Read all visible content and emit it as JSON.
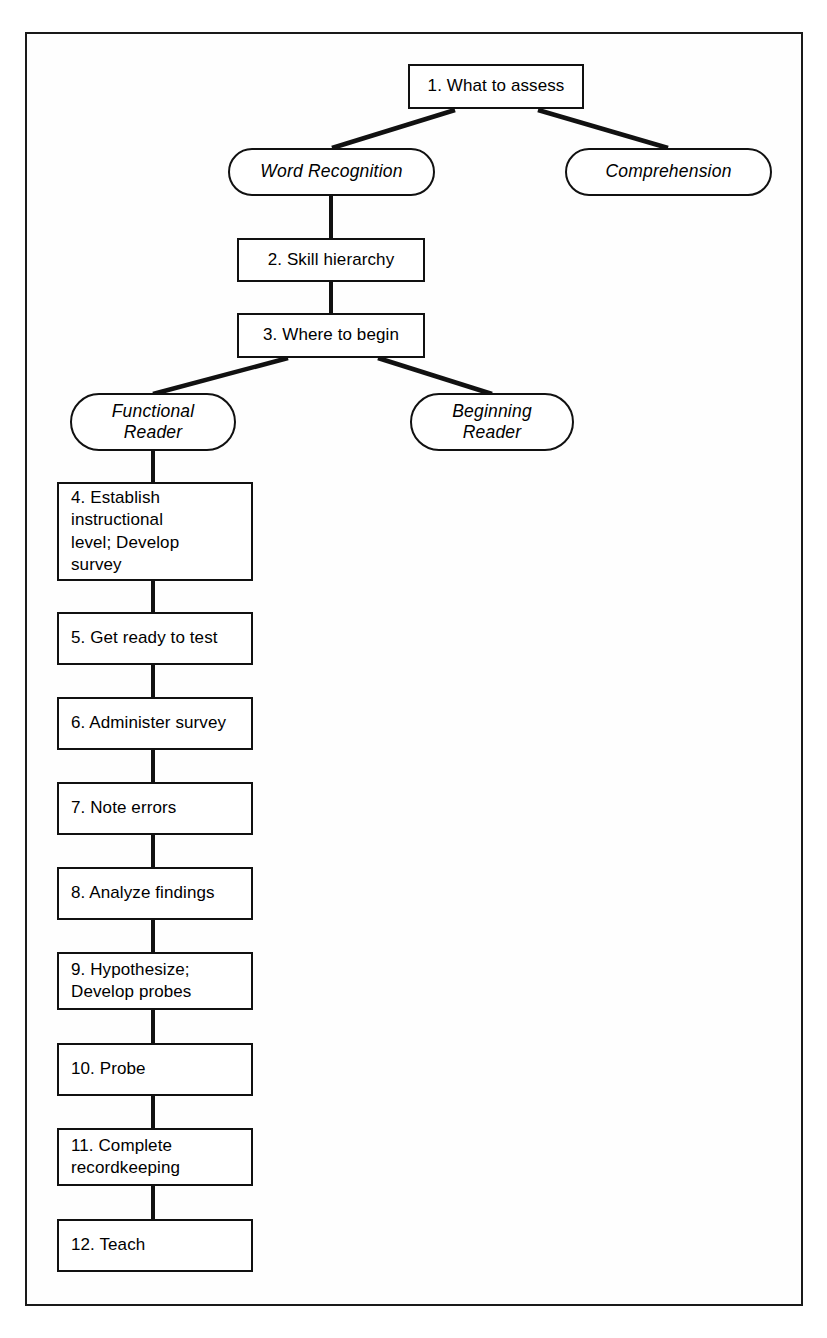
{
  "figure": {
    "frame": {
      "stroke_color": "#1a1a1a",
      "background": "#ffffff"
    },
    "line_color": "#111111"
  },
  "nodes": [
    {
      "id": "n1",
      "shape": "process",
      "label": "1.  What to assess",
      "x": 408,
      "y": 64,
      "w": 176,
      "h": 45,
      "align": "center"
    },
    {
      "id": "n2",
      "shape": "terminal",
      "label": "Word Recognition",
      "x": 228,
      "y": 148,
      "w": 207,
      "h": 48
    },
    {
      "id": "n3",
      "shape": "terminal",
      "label": "Comprehension",
      "x": 565,
      "y": 148,
      "w": 207,
      "h": 48
    },
    {
      "id": "n4",
      "shape": "process",
      "label": "2.  Skill hierarchy",
      "x": 237,
      "y": 238,
      "w": 188,
      "h": 44,
      "align": "center"
    },
    {
      "id": "n5",
      "shape": "process",
      "label": "3.  Where to begin",
      "x": 237,
      "y": 313,
      "w": 188,
      "h": 45,
      "align": "center"
    },
    {
      "id": "n6",
      "shape": "terminal",
      "label": "Functional\nReader",
      "x": 70,
      "y": 393,
      "w": 166,
      "h": 58
    },
    {
      "id": "n7",
      "shape": "terminal",
      "label": "Beginning\nReader",
      "x": 410,
      "y": 393,
      "w": 164,
      "h": 58
    },
    {
      "id": "n8",
      "shape": "process",
      "label": "4.  Establish\n     instructional\n     level; Develop\n     survey",
      "x": 57,
      "y": 482,
      "w": 196,
      "h": 99,
      "align": "left"
    },
    {
      "id": "n9",
      "shape": "process",
      "label": "5.  Get ready to test",
      "x": 57,
      "y": 612,
      "w": 196,
      "h": 53,
      "align": "left"
    },
    {
      "id": "n10",
      "shape": "process",
      "label": "6.  Administer survey",
      "x": 57,
      "y": 697,
      "w": 196,
      "h": 53,
      "align": "left"
    },
    {
      "id": "n11",
      "shape": "process",
      "label": "7.  Note errors",
      "x": 57,
      "y": 782,
      "w": 196,
      "h": 53,
      "align": "left"
    },
    {
      "id": "n12",
      "shape": "process",
      "label": "8.  Analyze findings",
      "x": 57,
      "y": 867,
      "w": 196,
      "h": 53,
      "align": "left"
    },
    {
      "id": "n13",
      "shape": "process",
      "label": "9.  Hypothesize;\n     Develop probes",
      "x": 57,
      "y": 952,
      "w": 196,
      "h": 58,
      "align": "left"
    },
    {
      "id": "n14",
      "shape": "process",
      "label": "10.  Probe",
      "x": 57,
      "y": 1043,
      "w": 196,
      "h": 53,
      "align": "left"
    },
    {
      "id": "n15",
      "shape": "process",
      "label": "11.  Complete\n       recordkeeping",
      "x": 57,
      "y": 1128,
      "w": 196,
      "h": 58,
      "align": "left"
    },
    {
      "id": "n16",
      "shape": "process",
      "label": "12.  Teach",
      "x": 57,
      "y": 1219,
      "w": 196,
      "h": 53,
      "align": "left"
    }
  ],
  "connectors": [
    {
      "id": "c1",
      "from": "n1",
      "to": "n2",
      "type": "diagonal",
      "x1": 455,
      "y1": 110,
      "x2": 332,
      "y2": 148
    },
    {
      "id": "c2",
      "from": "n1",
      "to": "n3",
      "type": "diagonal",
      "x1": 538,
      "y1": 110,
      "x2": 668,
      "y2": 148
    },
    {
      "id": "c3",
      "from": "n2",
      "to": "n4",
      "type": "vertical",
      "x1": 331,
      "y1": 196,
      "x2": 331,
      "y2": 238
    },
    {
      "id": "c4",
      "from": "n4",
      "to": "n5",
      "type": "vertical",
      "x1": 331,
      "y1": 282,
      "x2": 331,
      "y2": 313
    },
    {
      "id": "c5",
      "from": "n5",
      "to": "n6",
      "type": "diagonal",
      "x1": 288,
      "y1": 358,
      "x2": 153,
      "y2": 394
    },
    {
      "id": "c6",
      "from": "n5",
      "to": "n7",
      "type": "diagonal",
      "x1": 378,
      "y1": 358,
      "x2": 492,
      "y2": 394
    },
    {
      "id": "c7",
      "from": "n6",
      "to": "n8",
      "type": "vertical",
      "x1": 153,
      "y1": 451,
      "x2": 153,
      "y2": 482
    },
    {
      "id": "c8",
      "from": "n8",
      "to": "n9",
      "type": "vertical",
      "x1": 153,
      "y1": 581,
      "x2": 153,
      "y2": 612
    },
    {
      "id": "c9",
      "from": "n9",
      "to": "n10",
      "type": "vertical",
      "x1": 153,
      "y1": 665,
      "x2": 153,
      "y2": 697
    },
    {
      "id": "c10",
      "from": "n10",
      "to": "n11",
      "type": "vertical",
      "x1": 153,
      "y1": 750,
      "x2": 153,
      "y2": 782
    },
    {
      "id": "c11",
      "from": "n11",
      "to": "n12",
      "type": "vertical",
      "x1": 153,
      "y1": 835,
      "x2": 153,
      "y2": 867
    },
    {
      "id": "c12",
      "from": "n12",
      "to": "n13",
      "type": "vertical",
      "x1": 153,
      "y1": 920,
      "x2": 153,
      "y2": 952
    },
    {
      "id": "c13",
      "from": "n13",
      "to": "n14",
      "type": "vertical",
      "x1": 153,
      "y1": 1010,
      "x2": 153,
      "y2": 1043
    },
    {
      "id": "c14",
      "from": "n14",
      "to": "n15",
      "type": "vertical",
      "x1": 153,
      "y1": 1096,
      "x2": 153,
      "y2": 1128
    },
    {
      "id": "c15",
      "from": "n15",
      "to": "n16",
      "type": "vertical",
      "x1": 153,
      "y1": 1186,
      "x2": 153,
      "y2": 1219
    }
  ]
}
